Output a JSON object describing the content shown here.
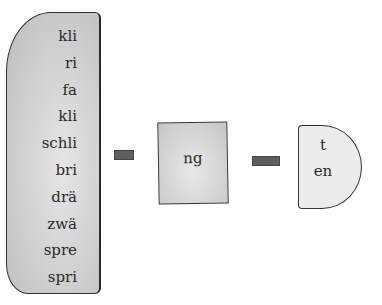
{
  "diagram": {
    "left_piece": {
      "syllables": [
        "kli",
        "ri",
        "fa",
        "kli",
        "schli",
        "bri",
        "drä",
        "zwä",
        "spre",
        "spri"
      ]
    },
    "middle_piece": {
      "text": "ng"
    },
    "right_piece": {
      "endings": [
        "t",
        "en"
      ]
    },
    "connectors": [
      {
        "from": "left_piece",
        "to": "middle_piece"
      },
      {
        "from": "middle_piece",
        "to": "right_piece"
      }
    ],
    "colors": {
      "left_fill": "#cfcfcf",
      "middle_fill": "#d4d4d4",
      "right_fill": "#ececec",
      "connector": "#5e5e5e",
      "outline": "#333333"
    }
  }
}
